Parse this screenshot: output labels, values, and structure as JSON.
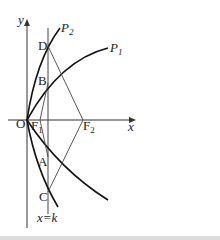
{
  "figure": {
    "axes": {
      "x_label": "x",
      "y_label": "y",
      "origin_label": "O"
    },
    "curves": [
      {
        "name": "P",
        "sub": "1"
      },
      {
        "name": "P",
        "sub": "2"
      }
    ],
    "points": {
      "D": "D",
      "B": "B",
      "A": "A",
      "C": "C",
      "F1": {
        "name": "F",
        "sub": "1"
      },
      "F2": {
        "name": "F",
        "sub": "2"
      }
    },
    "line_label": "x=k"
  }
}
